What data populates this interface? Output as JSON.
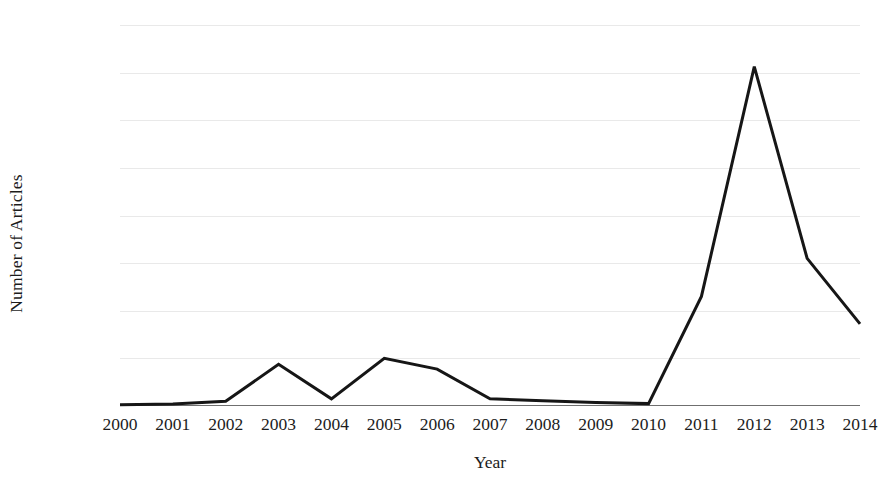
{
  "chart_data": {
    "type": "line",
    "title": "",
    "xlabel": "Year",
    "ylabel": "Number of Articles",
    "categories": [
      "2000",
      "2001",
      "2002",
      "2003",
      "2004",
      "2005",
      "2006",
      "2007",
      "2008",
      "2009",
      "2010",
      "2011",
      "2012",
      "2013",
      "2014"
    ],
    "x": [
      2000,
      2001,
      2002,
      2003,
      2004,
      2005,
      2006,
      2007,
      2008,
      2009,
      2010,
      2011,
      2012,
      2013,
      2014
    ],
    "values": [
      5,
      8,
      20,
      175,
      30,
      200,
      155,
      30,
      22,
      15,
      10,
      460,
      1425,
      620,
      345
    ],
    "series": [
      {
        "name": "Number of Articles",
        "values": [
          5,
          8,
          20,
          175,
          30,
          200,
          155,
          30,
          22,
          15,
          10,
          460,
          1425,
          620,
          345
        ]
      }
    ],
    "xlim": [
      2000,
      2014
    ],
    "ylim": [
      0,
      1600
    ],
    "yticks": [
      0,
      200,
      400,
      600,
      800,
      1000,
      1200,
      1400,
      1600
    ],
    "ytick_labels": [
      "0",
      "200",
      "400",
      "600",
      "800",
      "1000",
      "1200",
      "1400",
      "1600"
    ],
    "xtick_labels": [
      "2000",
      "2001",
      "2002",
      "2003",
      "2004",
      "2005",
      "2006",
      "2007",
      "2008",
      "2009",
      "2010",
      "2011",
      "2012",
      "2013",
      "2014"
    ],
    "grid": "horizontal",
    "legend": "none",
    "line_color": "#161616",
    "grid_color": "#e9e9e9",
    "axis_color": "#6f6f6f",
    "background_color": "#ffffff",
    "line_width": 3
  }
}
